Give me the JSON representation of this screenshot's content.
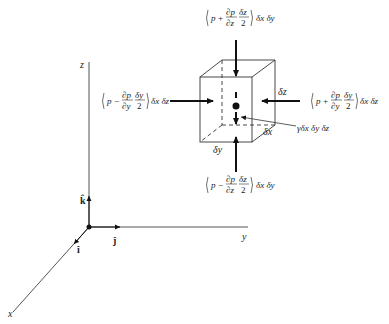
{
  "diagram": {
    "axes": {
      "x_label": "x",
      "y_label": "y",
      "z_label": "z",
      "unit_vectors": {
        "i": "î",
        "j": "ĵ",
        "k": "k̂"
      }
    },
    "cube": {
      "dx_label": "δx",
      "dy_label": "δy",
      "dz_label": "δz"
    },
    "forces": {
      "top": {
        "sign": "+",
        "deriv_num": "∂p",
        "deriv_den": "∂z",
        "half_num": "δz",
        "half_den": "2",
        "area": "δx δy"
      },
      "bottom": {
        "sign": "−",
        "deriv_num": "∂p",
        "deriv_den": "∂z",
        "half_num": "δz",
        "half_den": "2",
        "area": "δx δy"
      },
      "left": {
        "sign": "−",
        "deriv_num": "∂p",
        "deriv_den": "∂y",
        "half_num": "δy",
        "half_den": "2",
        "area": "δx δz"
      },
      "right": {
        "sign": "+",
        "deriv_num": "∂p",
        "deriv_den": "∂y",
        "half_num": "δy",
        "half_den": "2",
        "area": "δx δz"
      },
      "p": "p"
    },
    "weight_label": "γδx δy δz"
  }
}
